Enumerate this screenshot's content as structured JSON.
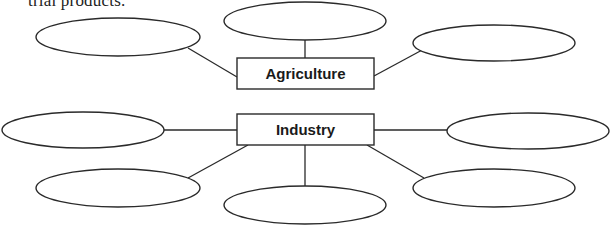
{
  "caption": "trial products.",
  "diagram": {
    "stroke_color": "#2a2a2a",
    "boxes": [
      {
        "id": "agriculture",
        "label": "Agriculture",
        "x": 237,
        "y": 58,
        "w": 137,
        "h": 31
      },
      {
        "id": "industry",
        "label": "Industry",
        "x": 237,
        "y": 114,
        "w": 137,
        "h": 31
      }
    ],
    "ovals": [
      {
        "id": "agri-top-left",
        "cx": 118,
        "cy": 37,
        "rx": 82,
        "ry": 19,
        "text": ""
      },
      {
        "id": "agri-top-center",
        "cx": 305,
        "cy": 21,
        "rx": 81,
        "ry": 19,
        "text": ""
      },
      {
        "id": "agri-top-right",
        "cx": 494,
        "cy": 43,
        "rx": 81,
        "ry": 18,
        "text": ""
      },
      {
        "id": "ind-left",
        "cx": 83,
        "cy": 130,
        "rx": 81,
        "ry": 18,
        "text": ""
      },
      {
        "id": "ind-right",
        "cx": 528,
        "cy": 131,
        "rx": 81,
        "ry": 18,
        "text": ""
      },
      {
        "id": "ind-bottom-left",
        "cx": 118,
        "cy": 188,
        "rx": 82,
        "ry": 19,
        "text": ""
      },
      {
        "id": "ind-bottom-center",
        "cx": 305,
        "cy": 205,
        "rx": 81,
        "ry": 19,
        "text": ""
      },
      {
        "id": "ind-bottom-right",
        "cx": 494,
        "cy": 188,
        "rx": 81,
        "ry": 19,
        "text": ""
      }
    ]
  }
}
